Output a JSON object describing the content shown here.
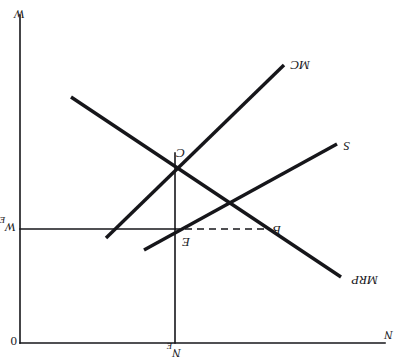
{
  "figure": {
    "orientation": "rotated-180",
    "line_color": "#16161a",
    "background_color": "#ffffff"
  },
  "axes": {
    "vertical_axis_label": "N",
    "vertical_axis_sub": "E",
    "horizontal_left_label": "N",
    "origin_label": "0",
    "wage_axis_label": "W",
    "wage_axis_sub": "E",
    "vertical_wage_label": "W"
  },
  "curves": [
    {
      "id": "mrp",
      "label": "MRP",
      "kind": "marginal-revenue-product",
      "slope": "downward"
    },
    {
      "id": "supply",
      "label": "S",
      "kind": "labour-supply",
      "slope": "upward"
    },
    {
      "id": "mc",
      "label": "MC",
      "kind": "marginal-cost-of-labour",
      "slope": "upward"
    }
  ],
  "points": [
    {
      "id": "b",
      "label": "B"
    },
    {
      "id": "e",
      "label": "E"
    },
    {
      "id": "c",
      "label": "C"
    }
  ],
  "geometry": {
    "top_rule": {
      "x1": 18,
      "y1": 17,
      "x2": 383,
      "y2": 17
    },
    "vertical_axis": {
      "x1": 228,
      "y1": 17,
      "x2": 228,
      "y2": 207
    },
    "right_axis": {
      "x1": 383,
      "y1": 17,
      "x2": 383,
      "y2": 345
    },
    "wage_rule": {
      "x1": 138,
      "y1": 131,
      "x2": 383,
      "y2": 131
    },
    "dashed_segment": {
      "x1": 138,
      "y1": 131,
      "x2": 228,
      "y2": 131
    },
    "mrp_line": {
      "x1": 62,
      "y1": 83,
      "x2": 332,
      "y2": 263
    },
    "supply_line": {
      "x1": 66,
      "y1": 216,
      "x2": 259,
      "y2": 110
    },
    "mc_line": {
      "x1": 119,
      "y1": 295,
      "x2": 297,
      "y2": 122
    }
  },
  "labels": {
    "mrp_label": "MRP",
    "supply_label": "S",
    "mc_label": "MC",
    "point_b": "B",
    "point_e": "E",
    "point_c": "C",
    "n_left": "N",
    "n_e_main": "N",
    "n_e_sub": "E",
    "origin": "0",
    "w_e_main": "W",
    "w_e_sub": "E",
    "w_bottom": "W"
  }
}
